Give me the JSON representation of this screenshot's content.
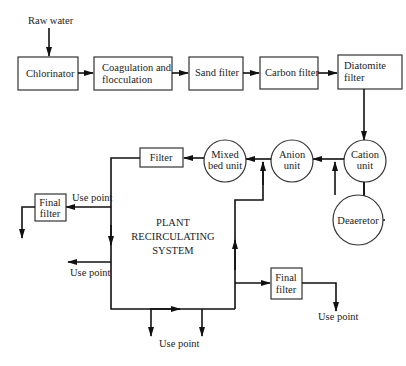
{
  "diagram": {
    "type": "process-flow",
    "nodes": {
      "raw_water": "Raw water",
      "chlorinator": "Chlorinator",
      "coagulation": [
        "Coagulation and",
        "flocculation"
      ],
      "sand_filter": "Sand filter",
      "carbon_filter": "Carbon filter",
      "diatomite_filter": [
        "Diatomite",
        "filter"
      ],
      "cation_unit": [
        "Cation",
        "unit"
      ],
      "anion_unit": [
        "Anion",
        "unit"
      ],
      "mixed_bed_unit": [
        "Mixed",
        "bed unit"
      ],
      "deaerator": "Deaeretor",
      "filter": "Filter",
      "final_filter_left": [
        "Final",
        "filter"
      ],
      "final_filter_right": [
        "Final",
        "filter"
      ],
      "system": [
        "PLANT",
        "RECIRCULATING",
        "SYSTEM"
      ]
    },
    "use_points": {
      "upper_left": "Use point",
      "mid_left": "Use point",
      "bottom": "Use point",
      "right": "Use point"
    },
    "edges": [
      [
        "Raw water",
        "Chlorinator"
      ],
      [
        "Chlorinator",
        "Coagulation and flocculation"
      ],
      [
        "Coagulation and flocculation",
        "Sand filter"
      ],
      [
        "Sand filter",
        "Carbon filter"
      ],
      [
        "Carbon filter",
        "Diatomite filter"
      ],
      [
        "Diatomite filter",
        "Cation unit"
      ],
      [
        "Cation unit",
        "Deaeretor"
      ],
      [
        "Deaeretor",
        "Anion unit"
      ],
      [
        "Cation unit",
        "Anion unit"
      ],
      [
        "Anion unit",
        "Mixed bed unit"
      ],
      [
        "Mixed bed unit",
        "Filter"
      ],
      [
        "Filter",
        "Plant recirculating system"
      ],
      [
        "Plant recirculating system",
        "Final filter (left)"
      ],
      [
        "Plant recirculating system",
        "Final filter (right)"
      ],
      [
        "Plant recirculating system",
        "Anion unit inlet"
      ]
    ]
  }
}
